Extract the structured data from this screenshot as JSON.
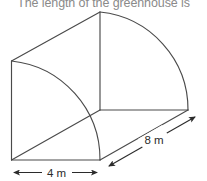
{
  "figure": {
    "caption": "The length of the greenhouse is",
    "type": "3d-geometry-diagram",
    "subject": "greenhouse",
    "solid": "quarter-cylinder prism",
    "stroke_color": "#4a4a4a",
    "background_color": "#ffffff",
    "caption_color": "#8a8a8a",
    "dimensions": [
      {
        "id": "width",
        "label": "4 m",
        "value": 4,
        "unit": "m",
        "orientation": "horizontal"
      },
      {
        "id": "length",
        "label": "8 m",
        "value": 8,
        "unit": "m",
        "orientation": "diagonal"
      }
    ],
    "labels": {
      "width": "4 m",
      "length": "8 m"
    }
  }
}
